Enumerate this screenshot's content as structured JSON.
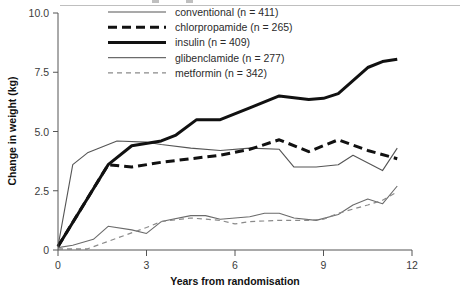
{
  "chart_data": {
    "type": "line",
    "title": "",
    "xlabel": "Years from randomisation",
    "ylabel": "Change in weight (kg)",
    "xlim": [
      0,
      12
    ],
    "ylim": [
      0,
      10
    ],
    "xticks": [
      0,
      3,
      6,
      9,
      12
    ],
    "xtick_labels": [
      "0",
      "3",
      "6",
      "9",
      "12"
    ],
    "yticks": [
      0,
      2.5,
      5.0,
      7.5,
      10.0
    ],
    "ytick_labels": [
      "0",
      "2.5",
      "5.0",
      "7.5",
      "10.0"
    ],
    "grid": false,
    "legend_position": "top-center",
    "series": [
      {
        "name": "conventional",
        "n": 411,
        "legend_label": "conventional (n = 411)",
        "style": "solid",
        "width": 1.1,
        "color": "#555555",
        "x": [
          0,
          0.5,
          1,
          2,
          3,
          3.5,
          4.5,
          5.5,
          6.5,
          7.5,
          8,
          8.75,
          9.5,
          10,
          11,
          11.5
        ],
        "y": [
          0.15,
          3.6,
          4.1,
          4.6,
          4.55,
          4.45,
          4.3,
          4.2,
          4.3,
          4.25,
          3.5,
          3.5,
          3.6,
          4.0,
          3.35,
          4.3
        ]
      },
      {
        "name": "chlorpropamide",
        "n": 265,
        "legend_label": "chlorpropamide (n = 265)",
        "style": "dashed",
        "width": 3.0,
        "color": "#111111",
        "x": [
          0,
          1.7,
          2.5,
          3.5,
          4.5,
          5.5,
          6.5,
          7.5,
          8.5,
          9.5,
          10.5,
          11.5
        ],
        "y": [
          0.15,
          3.6,
          3.5,
          3.7,
          3.85,
          4.0,
          4.25,
          4.65,
          4.15,
          4.65,
          4.2,
          3.85
        ]
      },
      {
        "name": "insulin",
        "n": 409,
        "legend_label": "insulin (n = 409)",
        "style": "solid",
        "width": 3.0,
        "color": "#111111",
        "x": [
          0,
          1.7,
          2.5,
          3.5,
          4.0,
          4.7,
          5.5,
          6.5,
          7.5,
          8.5,
          9.0,
          9.5,
          10.5,
          11.0,
          11.5
        ],
        "y": [
          0.15,
          3.6,
          4.4,
          4.6,
          4.85,
          5.5,
          5.5,
          6.0,
          6.5,
          6.35,
          6.4,
          6.6,
          7.7,
          7.95,
          8.05
        ]
      },
      {
        "name": "glibenclamide",
        "n": 277,
        "legend_label": "glibenclamide (n = 277)",
        "style": "solid",
        "width": 1.1,
        "color": "#6b6b6b",
        "x": [
          0,
          0.5,
          1.2,
          1.7,
          2.5,
          3.0,
          3.5,
          4.5,
          5.0,
          5.5,
          6.5,
          7.0,
          7.5,
          8.0,
          8.75,
          9.5,
          10.0,
          10.5,
          11.0,
          11.5
        ],
        "y": [
          0.1,
          0.2,
          0.45,
          1.0,
          0.85,
          0.7,
          1.2,
          1.45,
          1.45,
          1.3,
          1.4,
          1.55,
          1.55,
          1.35,
          1.25,
          1.5,
          1.9,
          2.15,
          1.95,
          2.7
        ]
      },
      {
        "name": "metformin",
        "n": 342,
        "legend_label": "metformin (n = 342)",
        "style": "dashed",
        "width": 1.2,
        "color": "#8a8a8a",
        "x": [
          0,
          1.0,
          2.0,
          3.0,
          3.5,
          4.5,
          5.5,
          6.0,
          6.5,
          7.5,
          8.5,
          9.0,
          9.5,
          10.5,
          11.0,
          11.5
        ],
        "y": [
          0.05,
          0.05,
          0.5,
          0.95,
          1.2,
          1.35,
          1.25,
          1.1,
          1.2,
          1.25,
          1.25,
          1.3,
          1.55,
          1.9,
          2.1,
          2.45
        ]
      }
    ]
  },
  "axes": {
    "ylabel": "Change in weight (kg)",
    "xlabel": "Years from randomisation"
  },
  "legend": {
    "items": [
      {
        "label": "conventional (n = 411)"
      },
      {
        "label": "chlorpropamide (n = 265)"
      },
      {
        "label": "insulin (n = 409)"
      },
      {
        "label": "glibenclamide (n = 277)"
      },
      {
        "label": "metformin (n = 342)"
      }
    ]
  }
}
